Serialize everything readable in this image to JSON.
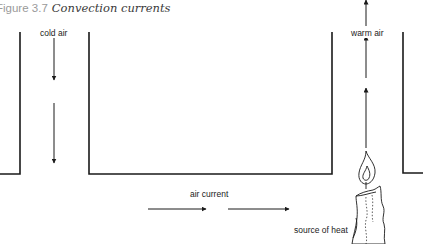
{
  "figure": {
    "number": "Figure 3.7",
    "title": "Convection currents"
  },
  "labels": {
    "cold_air": "cold air",
    "warm_air": "warm air",
    "air_current": "air current",
    "source_of_heat": "source of heat"
  },
  "colors": {
    "line": "#1a1a1a",
    "caption_number": "#9a9a9a",
    "caption_title": "#3a3a3a",
    "label_text": "#222222"
  }
}
